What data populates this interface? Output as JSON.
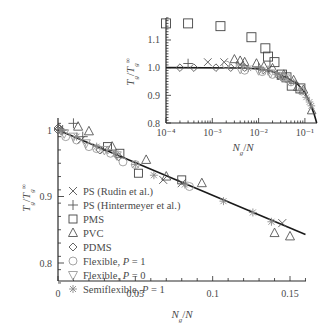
{
  "chart_data": [
    {
      "id": "main",
      "type": "scatter",
      "title": "",
      "xlabel": "N_g/N",
      "ylabel": "T_g/T_g^∞",
      "xlim": [
        0,
        0.16
      ],
      "ylim": [
        0.76,
        1.02
      ],
      "x_ticks": [
        0,
        0.05,
        0.1,
        0.15
      ],
      "x_tick_labels": [
        "0",
        "0.05",
        "0.1",
        "0.15"
      ],
      "y_ticks": [
        0.8,
        0.9,
        1.0
      ],
      "y_tick_labels": [
        "0.8",
        "0.9",
        "1"
      ],
      "grid": false,
      "legend_position": "center-left",
      "fit_line": {
        "x": [
          0,
          0.16
        ],
        "y": [
          1.0,
          0.843
        ]
      },
      "series": [
        {
          "name": "PS (Rudin et al.)",
          "marker": "x",
          "color": "#555555",
          "x": [
            0.015,
            0.03,
            0.068,
            0.08,
            0.145
          ],
          "y": [
            0.985,
            0.97,
            0.925,
            0.92,
            0.86
          ]
        },
        {
          "name": "PS (Hintermeyer et al.)",
          "marker": "plus",
          "color": "#555555",
          "x": [
            0.003,
            0.01,
            0.016
          ],
          "y": [
            1.0,
            1.01,
            0.99
          ]
        },
        {
          "name": "PMS",
          "marker": "square",
          "color": "#444444",
          "x": [
            0.032,
            0.04,
            0.052,
            0.08
          ],
          "y": [
            0.975,
            0.965,
            0.935,
            0.925
          ]
        },
        {
          "name": "PVC",
          "marker": "triangle-up",
          "color": "#555555",
          "x": [
            0.013,
            0.02,
            0.035,
            0.057,
            0.07,
            0.093,
            0.14,
            0.15
          ],
          "y": [
            1.005,
            0.998,
            0.975,
            0.955,
            0.93,
            0.92,
            0.845,
            0.84
          ]
        },
        {
          "name": "PDMS",
          "marker": "diamond",
          "color": "#555555",
          "x": [
            0.0,
            0.0,
            0.001,
            0.002,
            0.027,
            0.039
          ],
          "y": [
            1.003,
            1.0,
            1.002,
            0.999,
            0.97,
            0.96
          ]
        },
        {
          "name": "Flexible, P = 1",
          "marker": "circle",
          "color": "#9a9a9a",
          "x": [
            0.005,
            0.012,
            0.02,
            0.025,
            0.034,
            0.042,
            0.05,
            0.085
          ],
          "y": [
            0.99,
            0.985,
            0.975,
            0.972,
            0.965,
            0.952,
            0.948,
            0.915
          ]
        },
        {
          "name": "Flexible, P = 0",
          "marker": "triangle-down",
          "color": "#9a9a9a",
          "x": [
            0.004,
            0.01,
            0.018,
            0.03,
            0.038
          ],
          "y": [
            0.995,
            0.99,
            0.98,
            0.97,
            0.962
          ]
        },
        {
          "name": "Semiflexible, P = 1",
          "marker": "asterisk",
          "color": "#8a8a8a",
          "x": [
            0.002,
            0.012,
            0.025,
            0.037,
            0.05,
            0.062,
            0.082,
            0.107,
            0.126,
            0.138
          ],
          "y": [
            0.998,
            0.99,
            0.975,
            0.965,
            0.948,
            0.932,
            0.918,
            0.893,
            0.876,
            0.862
          ]
        }
      ]
    },
    {
      "id": "inset",
      "type": "scatter",
      "title": "",
      "xlabel": "N_g/N",
      "ylabel": "T_g/T_g^∞",
      "xscale": "log",
      "xlim": [
        0.0001,
        0.18
      ],
      "ylim": [
        0.8,
        1.18
      ],
      "x_ticks": [
        0.0001,
        0.001,
        0.01,
        0.1
      ],
      "x_tick_labels": [
        "10⁻⁴",
        "10⁻³",
        "10⁻²",
        "10⁻¹"
      ],
      "y_ticks": [
        0.8,
        0.9,
        1.0,
        1.1
      ],
      "y_tick_labels": [
        "0.8",
        "0.9",
        "1.0",
        "1.1"
      ],
      "grid": false,
      "fit_line": {
        "x": [
          0.0001,
          0.005,
          0.01,
          0.02,
          0.04,
          0.07,
          0.1,
          0.13,
          0.16,
          0.18
        ],
        "y": [
          1.0,
          0.999,
          0.995,
          0.985,
          0.965,
          0.94,
          0.91,
          0.87,
          0.83,
          0.8
        ]
      },
      "series": [
        {
          "name": "PS (Rudin et al.)",
          "marker": "x",
          "color": "#555555",
          "x": [
            0.0008,
            0.0018,
            0.004,
            0.015,
            0.03
          ],
          "y": [
            1.02,
            1.02,
            1.01,
            0.99,
            0.97
          ]
        },
        {
          "name": "PS (Hintermeyer et al.)",
          "marker": "plus",
          "color": "#555555",
          "x": [
            0.0003,
            0.01,
            0.016
          ],
          "y": [
            1.015,
            1.0,
            0.99
          ]
        },
        {
          "name": "PMS",
          "marker": "square",
          "color": "#444444",
          "x": [
            0.0001,
            0.0003,
            0.0015,
            0.007,
            0.014,
            0.016,
            0.022,
            0.032,
            0.04,
            0.052,
            0.08
          ],
          "y": [
            1.16,
            1.16,
            1.15,
            1.11,
            1.07,
            1.04,
            1.02,
            0.975,
            0.965,
            0.935,
            0.925
          ]
        },
        {
          "name": "PVC",
          "marker": "triangle-up",
          "color": "#555555",
          "x": [
            0.003,
            0.004,
            0.005,
            0.009,
            0.013,
            0.02,
            0.035,
            0.057,
            0.07,
            0.093,
            0.14
          ],
          "y": [
            1.03,
            1.025,
            1.02,
            1.015,
            1.005,
            0.998,
            0.975,
            0.955,
            0.93,
            0.92,
            0.845
          ]
        },
        {
          "name": "PDMS",
          "marker": "diamond",
          "color": "#555555",
          "x": [
            0.0002,
            0.0004,
            0.0012,
            0.0025,
            0.005,
            0.027,
            0.039
          ],
          "y": [
            1.0,
            1.0,
            1.0,
            1.0,
            1.0,
            0.97,
            0.96
          ]
        },
        {
          "name": "Flexible, P = 1",
          "marker": "circle",
          "color": "#9a9a9a",
          "x": [
            0.002,
            0.005,
            0.012,
            0.02,
            0.034,
            0.05,
            0.085
          ],
          "y": [
            1.01,
            0.99,
            0.985,
            0.975,
            0.965,
            0.948,
            0.915
          ]
        },
        {
          "name": "Flexible, P = 0",
          "marker": "triangle-down",
          "color": "#9a9a9a",
          "x": [
            0.004,
            0.01,
            0.018,
            0.03,
            0.038
          ],
          "y": [
            0.995,
            0.99,
            0.98,
            0.97,
            0.962
          ]
        },
        {
          "name": "Semiflexible, P = 1",
          "marker": "asterisk",
          "color": "#8a8a8a",
          "x": [
            0.006,
            0.012,
            0.025,
            0.05,
            0.082,
            0.107,
            0.126,
            0.138
          ],
          "y": [
            0.998,
            0.99,
            0.975,
            0.948,
            0.918,
            0.893,
            0.876,
            0.862
          ]
        }
      ]
    }
  ],
  "legend": [
    {
      "marker": "x",
      "label": "PS (Rudin et al.)"
    },
    {
      "marker": "plus",
      "label": "PS (Hintermeyer et al.)"
    },
    {
      "marker": "square",
      "label": "PMS"
    },
    {
      "marker": "triangle-up",
      "label": "PVC"
    },
    {
      "marker": "diamond",
      "label": "PDMS"
    },
    {
      "marker": "circle",
      "label": "Flexible, P = 1"
    },
    {
      "marker": "triangle-down",
      "label": "Flexible, P = 0"
    },
    {
      "marker": "asterisk",
      "label": "Semiflexible, P = 1"
    }
  ]
}
